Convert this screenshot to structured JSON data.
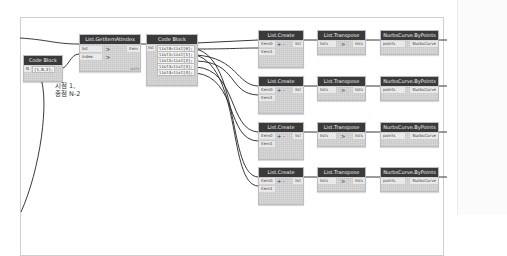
{
  "canvas": {
    "annotation": [
      "시점 1,",
      "종점 N-2"
    ]
  },
  "nodes": {
    "code_block_small": {
      "title": "Code Block",
      "input_label": "N",
      "code": "[1,N,2];"
    },
    "get_item": {
      "title": "List.GetItemAtIndex",
      "inputs": [
        "list",
        "index"
      ],
      "output": "item",
      "lacing": "AUTO"
    },
    "code_block_main": {
      "title": "Code Block",
      "input_label": "list",
      "lines": [
        "list0=list[0];",
        "list1=list[1];",
        "list2=list[2];",
        "list3=list[3];",
        "list4=list[4];"
      ]
    },
    "rows": [
      {
        "create": {
          "title": "List.Create",
          "inputs": [
            "item0",
            "item1"
          ],
          "plus": "+",
          "minus": "-",
          "output": "list"
        },
        "transpose": {
          "title": "List.Transpose",
          "input": "lists",
          "output": "lists"
        },
        "nurbs": {
          "title": "NurbsCurve.ByPoints",
          "input": "points",
          "output": "NurbsCurve"
        }
      },
      {
        "create": {
          "title": "List.Create",
          "inputs": [
            "item0",
            "item1"
          ],
          "plus": "+",
          "minus": "-",
          "output": "list"
        },
        "transpose": {
          "title": "List.Transpose",
          "input": "lists",
          "output": "lists"
        },
        "nurbs": {
          "title": "NurbsCurve.ByPoints",
          "input": "points",
          "output": "NurbsCurve"
        }
      },
      {
        "create": {
          "title": "List.Create",
          "inputs": [
            "item0",
            "item1"
          ],
          "plus": "+",
          "minus": "-",
          "output": "list"
        },
        "transpose": {
          "title": "List.Transpose",
          "input": "lists",
          "output": "lists"
        },
        "nurbs": {
          "title": "NurbsCurve.ByPoints",
          "input": "points",
          "output": "NurbsCurve"
        }
      },
      {
        "create": {
          "title": "List.Create",
          "inputs": [
            "item0",
            "item1"
          ],
          "plus": "+",
          "minus": "-",
          "output": "list"
        },
        "transpose": {
          "title": "List.Transpose",
          "input": "lists",
          "output": "lists"
        },
        "nurbs": {
          "title": "NurbsCurve.ByPoints",
          "input": "points",
          "output": "NurbsCurve"
        }
      }
    ],
    "chevron": ">"
  }
}
